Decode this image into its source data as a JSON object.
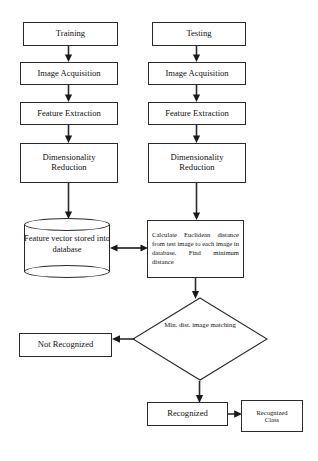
{
  "diagram": {
    "type": "flowchart",
    "stroke_color": "#2a2a2a",
    "background_color": "#ffffff",
    "columns": {
      "left_label": "Training",
      "right_label": "Testing"
    },
    "nodes": {
      "training": "Training",
      "testing": "Testing",
      "image_acquisition_left": "Image Acquisition",
      "image_acquisition_right": "Image Acquisition",
      "feature_extraction_left": "Feature Extraction",
      "feature_extraction_right": "Feature Extraction",
      "dimensionality_reduction_left_line1": "Dimensionality",
      "dimensionality_reduction_left_line2": "Reduction",
      "dimensionality_reduction_right_line1": "Dimensionality",
      "dimensionality_reduction_right_line2": "Reduction",
      "feature_vector_db_line1": "Feature vector",
      "feature_vector_db_line2": "stored into",
      "feature_vector_db_line3": "database",
      "calculate_euclidean": "Calculate Euclidean distance from test image to each image in database. Find minimum distance",
      "min_dist_decision_line1": "Min. dist. image",
      "min_dist_decision_line2": "matching",
      "not_recognized": "Not Recognized",
      "recognized": "Recognized",
      "recognized_class_line1": "Recognized",
      "recognized_class_line2": "Class"
    },
    "edges": [
      {
        "name": "training-to-acquisition",
        "from": "training",
        "to": "image_acquisition_left",
        "arrow": "single"
      },
      {
        "name": "acquisition-to-feature-left",
        "from": "image_acquisition_left",
        "to": "feature_extraction_left",
        "arrow": "single"
      },
      {
        "name": "feature-to-dimensionality-left",
        "from": "feature_extraction_left",
        "to": "dimensionality_reduction_left",
        "arrow": "single"
      },
      {
        "name": "dimensionality-to-database",
        "from": "dimensionality_reduction_left",
        "to": "feature_vector_db",
        "arrow": "single"
      },
      {
        "name": "testing-to-acquisition",
        "from": "testing",
        "to": "image_acquisition_right",
        "arrow": "single"
      },
      {
        "name": "acquisition-to-feature-right",
        "from": "image_acquisition_right",
        "to": "feature_extraction_right",
        "arrow": "single"
      },
      {
        "name": "feature-to-dimensionality-right",
        "from": "feature_extraction_right",
        "to": "dimensionality_reduction_right",
        "arrow": "single"
      },
      {
        "name": "dimensionality-to-calculate",
        "from": "dimensionality_reduction_right",
        "to": "calculate_euclidean",
        "arrow": "single"
      },
      {
        "name": "database-to-calculate",
        "from": "feature_vector_db",
        "to": "calculate_euclidean",
        "arrow": "double"
      },
      {
        "name": "calculate-to-decision",
        "from": "calculate_euclidean",
        "to": "min_dist_decision",
        "arrow": "single"
      },
      {
        "name": "decision-to-not-recognized",
        "from": "min_dist_decision",
        "to": "not_recognized",
        "arrow": "single"
      },
      {
        "name": "decision-to-recognized",
        "from": "min_dist_decision",
        "to": "recognized",
        "arrow": "single"
      },
      {
        "name": "recognized-to-class",
        "from": "recognized",
        "to": "recognized_class",
        "arrow": "single"
      }
    ]
  }
}
